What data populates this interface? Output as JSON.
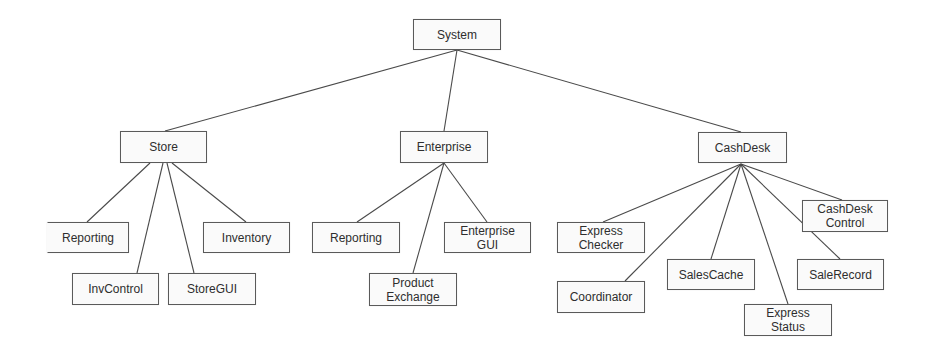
{
  "diagram": {
    "type": "component-hierarchy",
    "root": {
      "id": "system",
      "label": "System",
      "children": [
        "store",
        "enterprise",
        "cashdesk"
      ]
    },
    "nodes": [
      {
        "id": "system",
        "label": "System",
        "x": 413,
        "y": 19,
        "w": 88,
        "h": 31
      },
      {
        "id": "store",
        "label": "Store",
        "x": 120,
        "y": 131,
        "w": 87,
        "h": 32
      },
      {
        "id": "enterprise",
        "label": "Enterprise",
        "x": 400,
        "y": 131,
        "w": 88,
        "h": 32
      },
      {
        "id": "cashdesk",
        "label": "CashDesk",
        "x": 698,
        "y": 132,
        "w": 89,
        "h": 31
      },
      {
        "id": "store-reporting",
        "label": "Reporting",
        "x": 47,
        "y": 222,
        "w": 82,
        "h": 31,
        "noleft": true
      },
      {
        "id": "inventory",
        "label": "Inventory",
        "x": 203,
        "y": 222,
        "w": 87,
        "h": 31
      },
      {
        "id": "invcontrol",
        "label": "InvControl",
        "x": 72,
        "y": 273,
        "w": 87,
        "h": 32
      },
      {
        "id": "storegui",
        "label": "StoreGUI",
        "x": 168,
        "y": 273,
        "w": 88,
        "h": 32
      },
      {
        "id": "ent-reporting",
        "label": "Reporting",
        "x": 312,
        "y": 222,
        "w": 88,
        "h": 31
      },
      {
        "id": "enterprise-gui",
        "label": "Enterprise\nGUI",
        "x": 444,
        "y": 222,
        "w": 87,
        "h": 31
      },
      {
        "id": "product-exchange",
        "label": "Product\nExchange",
        "x": 369,
        "y": 273,
        "w": 88,
        "h": 33
      },
      {
        "id": "express-checker",
        "label": "Express\nChecker",
        "x": 557,
        "y": 222,
        "w": 88,
        "h": 31
      },
      {
        "id": "coordinator",
        "label": "Coordinator",
        "x": 557,
        "y": 281,
        "w": 88,
        "h": 32
      },
      {
        "id": "salescache",
        "label": "SalesCache",
        "x": 667,
        "y": 259,
        "w": 88,
        "h": 31
      },
      {
        "id": "express-status",
        "label": "Express\nStatus",
        "x": 744,
        "y": 304,
        "w": 88,
        "h": 32
      },
      {
        "id": "salerecord",
        "label": "SaleRecord",
        "x": 797,
        "y": 259,
        "w": 87,
        "h": 31
      },
      {
        "id": "cashdesk-control",
        "label": "CashDesk\nControl",
        "x": 802,
        "y": 200,
        "w": 86,
        "h": 32
      }
    ],
    "edges": [
      {
        "from": "system",
        "to": "store",
        "x1": 457,
        "y1": 50,
        "x2": 165,
        "y2": 131
      },
      {
        "from": "system",
        "to": "enterprise",
        "x1": 457,
        "y1": 50,
        "x2": 444,
        "y2": 131
      },
      {
        "from": "system",
        "to": "cashdesk",
        "x1": 457,
        "y1": 50,
        "x2": 741,
        "y2": 132
      },
      {
        "from": "store",
        "to": "store-reporting",
        "x1": 150,
        "y1": 163,
        "x2": 87,
        "y2": 222
      },
      {
        "from": "store",
        "to": "invcontrol",
        "x1": 163,
        "y1": 163,
        "x2": 137,
        "y2": 273
      },
      {
        "from": "store",
        "to": "storegui",
        "x1": 167,
        "y1": 163,
        "x2": 194,
        "y2": 273
      },
      {
        "from": "store",
        "to": "inventory",
        "x1": 172,
        "y1": 163,
        "x2": 246,
        "y2": 222
      },
      {
        "from": "enterprise",
        "to": "ent-reporting",
        "x1": 444,
        "y1": 163,
        "x2": 357,
        "y2": 222
      },
      {
        "from": "enterprise",
        "to": "product-exchange",
        "x1": 444,
        "y1": 163,
        "x2": 413,
        "y2": 273
      },
      {
        "from": "enterprise",
        "to": "enterprise-gui",
        "x1": 444,
        "y1": 163,
        "x2": 487,
        "y2": 222
      },
      {
        "from": "cashdesk",
        "to": "express-checker",
        "x1": 741,
        "y1": 164,
        "x2": 603,
        "y2": 222
      },
      {
        "from": "cashdesk",
        "to": "coordinator",
        "x1": 741,
        "y1": 164,
        "x2": 625,
        "y2": 281
      },
      {
        "from": "cashdesk",
        "to": "salescache",
        "x1": 741,
        "y1": 164,
        "x2": 711,
        "y2": 259
      },
      {
        "from": "cashdesk",
        "to": "express-status",
        "x1": 741,
        "y1": 164,
        "x2": 788,
        "y2": 304
      },
      {
        "from": "cashdesk",
        "to": "salerecord",
        "x1": 741,
        "y1": 164,
        "x2": 840,
        "y2": 259
      },
      {
        "from": "cashdesk",
        "to": "cashdesk-control",
        "x1": 741,
        "y1": 164,
        "x2": 842,
        "y2": 200
      }
    ]
  }
}
